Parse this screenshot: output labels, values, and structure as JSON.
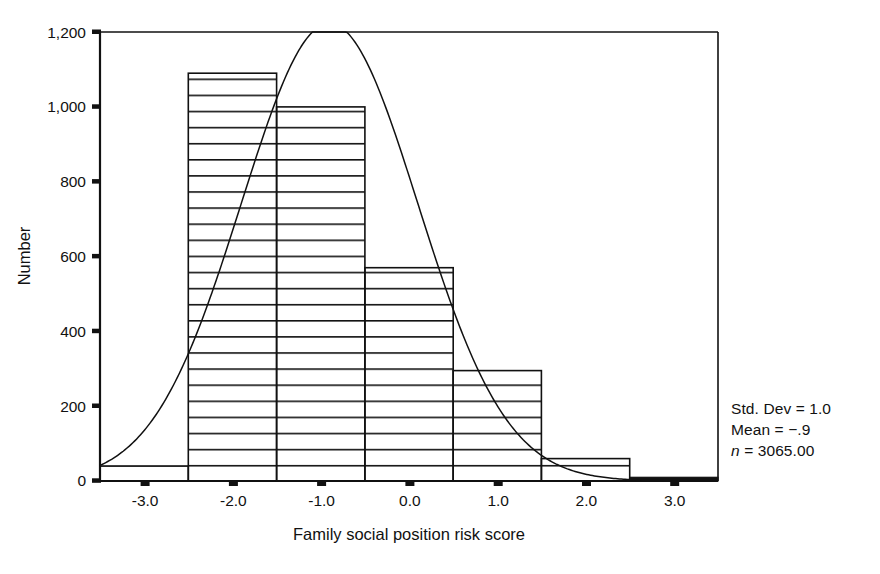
{
  "chart_data": {
    "type": "bar",
    "title": "",
    "subtitle": "",
    "xlabel": "Family social position risk score",
    "ylabel": "Number",
    "xlim": [
      -3.5,
      3.5
    ],
    "ylim": [
      0,
      1200
    ],
    "grid": false,
    "legend_position": "none",
    "bin_width": 1.0,
    "bar_fill": "horizontal-hatch",
    "categories": [
      "-3.0",
      "-2.0",
      "-1.0",
      "0.0",
      "1.0",
      "2.0",
      "3.0"
    ],
    "bin_centers": [
      -3.0,
      -2.0,
      -1.0,
      0.0,
      1.0,
      2.0,
      3.0
    ],
    "bin_edges": [
      -3.5,
      -2.5,
      -1.5,
      -0.5,
      0.5,
      1.5,
      2.5,
      3.5
    ],
    "values": [
      40,
      1090,
      1000,
      570,
      295,
      60,
      10
    ],
    "xticks": [
      "-3.0",
      "-2.0",
      "-1.0",
      "0.0",
      "1.0",
      "2.0",
      "3.0"
    ],
    "xtick_values": [
      -3.0,
      -2.0,
      -1.0,
      0.0,
      1.0,
      2.0,
      3.0
    ],
    "yticks": [
      "0",
      "200",
      "400",
      "600",
      "800",
      "1,000",
      "1,200"
    ],
    "ytick_values": [
      0,
      200,
      400,
      600,
      800,
      1000,
      1200
    ],
    "series": [
      {
        "name": "Histogram",
        "type": "bar",
        "values": [
          40,
          1090,
          1000,
          570,
          295,
          60,
          10
        ]
      },
      {
        "name": "Normal curve overlay",
        "type": "line",
        "mean": -0.9,
        "std_dev": 1.0,
        "n": 3065,
        "peak_value": 1120,
        "peak_x": -0.9
      }
    ],
    "annotations": [
      "Std. Dev = 1.0",
      "Mean = −.9",
      "n = 3065.00"
    ]
  },
  "stats": {
    "std_dev_label": "Std. Dev = 1.0",
    "mean_label": "Mean = −.9",
    "n_symbol": "n",
    "n_value": " = 3065.00"
  },
  "colors": {
    "axis": "#111111",
    "bar_outline": "#111111",
    "hatch": "#111111",
    "curve": "#111111",
    "background": "#ffffff"
  }
}
